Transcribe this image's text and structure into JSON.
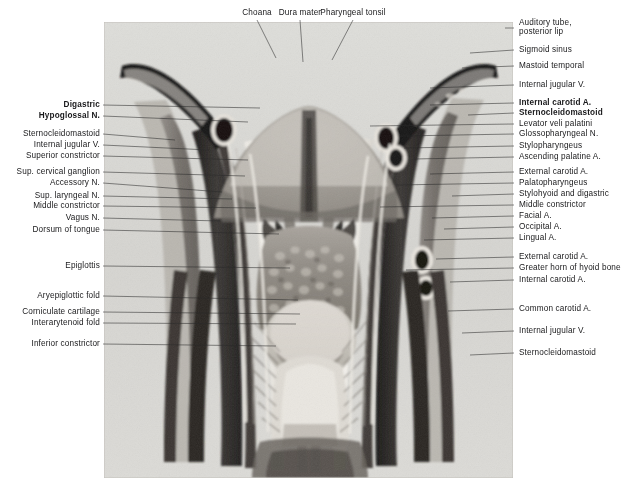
{
  "figure": {
    "kind": "anatomical-photograph",
    "caption_top_labels": [
      "Choana",
      "Dura mater",
      "Pharyngeal tonsil"
    ],
    "plate": {
      "x": 104,
      "y": 22,
      "width": 409,
      "height": 456,
      "background": "#d9d9d7",
      "description": "Posterior view dissection of the pharynx and neck"
    }
  },
  "top_labels": [
    {
      "text": "Choana",
      "x": 257,
      "y": 8,
      "line_to_x": 276,
      "line_to_y": 58
    },
    {
      "text": "Dura mater",
      "x": 300,
      "y": 8,
      "line_to_x": 303,
      "line_to_y": 62
    },
    {
      "text": "Pharyngeal tonsil",
      "x": 353,
      "y": 8,
      "line_to_x": 332,
      "line_to_y": 60
    }
  ],
  "left_labels": [
    {
      "text": "Digastric",
      "y": 105,
      "bold": true,
      "tip_x": 260,
      "tip_y": 108
    },
    {
      "text": "Hypoglossal N.",
      "y": 116,
      "bold": true,
      "tip_x": 248,
      "tip_y": 122
    },
    {
      "text": "Sternocleidomastoid",
      "y": 134,
      "bold": false,
      "tip_x": 175,
      "tip_y": 140
    },
    {
      "text": "Internal jugular V.",
      "y": 145,
      "bold": false,
      "tip_x": 209,
      "tip_y": 150
    },
    {
      "text": "Superior constrictor",
      "y": 156,
      "bold": false,
      "tip_x": 248,
      "tip_y": 160
    },
    {
      "text": "Sup. cervical ganglion",
      "y": 172,
      "bold": false,
      "tip_x": 245,
      "tip_y": 176
    },
    {
      "text": "Accessory N.",
      "y": 183,
      "bold": false,
      "tip_x": 222,
      "tip_y": 192
    },
    {
      "text": "Sup. laryngeal N.",
      "y": 196,
      "bold": false,
      "tip_x": 232,
      "tip_y": 199
    },
    {
      "text": "Middle constrictor",
      "y": 206,
      "bold": false,
      "tip_x": 256,
      "tip_y": 208
    },
    {
      "text": "Vagus N.",
      "y": 218,
      "bold": false,
      "tip_x": 220,
      "tip_y": 221
    },
    {
      "text": "Dorsum of tongue",
      "y": 230,
      "bold": false,
      "tip_x": 279,
      "tip_y": 234
    },
    {
      "text": "Epiglottis",
      "y": 266,
      "bold": false,
      "tip_x": 290,
      "tip_y": 268
    },
    {
      "text": "Aryepiglottic fold",
      "y": 296,
      "bold": false,
      "tip_x": 298,
      "tip_y": 300
    },
    {
      "text": "Corniculate cartilage",
      "y": 312,
      "bold": false,
      "tip_x": 300,
      "tip_y": 314
    },
    {
      "text": "Interarytenoid fold",
      "y": 323,
      "bold": false,
      "tip_x": 296,
      "tip_y": 324
    },
    {
      "text": "Inferior constrictor",
      "y": 344,
      "bold": false,
      "tip_x": 276,
      "tip_y": 346
    }
  ],
  "right_labels": [
    {
      "text": "Auditory tube,",
      "y": 23,
      "bold": false,
      "leader": false,
      "tip_x": 498,
      "tip_y": 30
    },
    {
      "text": "posterior lip",
      "y": 32,
      "bold": false,
      "leader": false,
      "tip_x": 498,
      "tip_y": 30
    },
    {
      "text": "Sigmoid sinus",
      "y": 50,
      "bold": false,
      "leader": true,
      "tip_x": 470,
      "tip_y": 53
    },
    {
      "text": "Mastoid temporal",
      "y": 66,
      "bold": false,
      "leader": true,
      "tip_x": 462,
      "tip_y": 68
    },
    {
      "text": "Internal jugular V.",
      "y": 85,
      "bold": false,
      "leader": true,
      "tip_x": 430,
      "tip_y": 88
    },
    {
      "text": "Internal carotid A.",
      "y": 103,
      "bold": true,
      "leader": true,
      "tip_x": 430,
      "tip_y": 105
    },
    {
      "text": "Sternocleidomastoid",
      "y": 113,
      "bold": true,
      "leader": true,
      "tip_x": 468,
      "tip_y": 115
    },
    {
      "text": "Levator veli palatini",
      "y": 124,
      "bold": false,
      "leader": true,
      "tip_x": 370,
      "tip_y": 126
    },
    {
      "text": "Glossopharyngeal N.",
      "y": 134,
      "bold": false,
      "leader": true,
      "tip_x": 400,
      "tip_y": 136
    },
    {
      "text": "Stylopharyngeus",
      "y": 146,
      "bold": false,
      "leader": true,
      "tip_x": 404,
      "tip_y": 148
    },
    {
      "text": "Ascending palatine A.",
      "y": 157,
      "bold": false,
      "leader": true,
      "tip_x": 414,
      "tip_y": 159
    },
    {
      "text": "External carotid A.",
      "y": 172,
      "bold": false,
      "leader": true,
      "tip_x": 430,
      "tip_y": 174
    },
    {
      "text": "Palatopharyngeus",
      "y": 183,
      "bold": false,
      "leader": true,
      "tip_x": 396,
      "tip_y": 185
    },
    {
      "text": "Stylohyoid and digastric",
      "y": 194,
      "bold": false,
      "leader": true,
      "tip_x": 452,
      "tip_y": 196
    },
    {
      "text": "Middle constrictor",
      "y": 205,
      "bold": false,
      "leader": true,
      "tip_x": 380,
      "tip_y": 207
    },
    {
      "text": "Facial A.",
      "y": 216,
      "bold": false,
      "leader": true,
      "tip_x": 432,
      "tip_y": 218
    },
    {
      "text": "Occipital A.",
      "y": 227,
      "bold": false,
      "leader": true,
      "tip_x": 444,
      "tip_y": 229
    },
    {
      "text": "Lingual A.",
      "y": 238,
      "bold": false,
      "leader": true,
      "tip_x": 424,
      "tip_y": 240
    },
    {
      "text": "External carotid A.",
      "y": 257,
      "bold": false,
      "leader": true,
      "tip_x": 436,
      "tip_y": 259
    },
    {
      "text": "Greater horn of hyoid bone",
      "y": 268,
      "bold": false,
      "leader": true,
      "tip_x": 406,
      "tip_y": 270
    },
    {
      "text": "Internal carotid A.",
      "y": 280,
      "bold": false,
      "leader": true,
      "tip_x": 450,
      "tip_y": 282
    },
    {
      "text": "Common carotid A.",
      "y": 309,
      "bold": false,
      "leader": true,
      "tip_x": 448,
      "tip_y": 311
    },
    {
      "text": "Internal jugular V.",
      "y": 331,
      "bold": false,
      "leader": true,
      "tip_x": 462,
      "tip_y": 333
    },
    {
      "text": "Sternocleidomastoid",
      "y": 353,
      "bold": false,
      "leader": true,
      "tip_x": 470,
      "tip_y": 355
    }
  ],
  "geometry": {
    "left_text_right_edge": 100,
    "left_leader_start_x": 104,
    "right_text_left_edge": 519,
    "right_leader_end_x": 515
  },
  "colors": {
    "plate_bg": "#d9d9d7",
    "ink": "#19191b",
    "leader": "#2a2a2a",
    "dark_tissue": "#2f2d2c",
    "mid_tissue": "#7a7672",
    "light_tissue": "#c9c5c0"
  }
}
